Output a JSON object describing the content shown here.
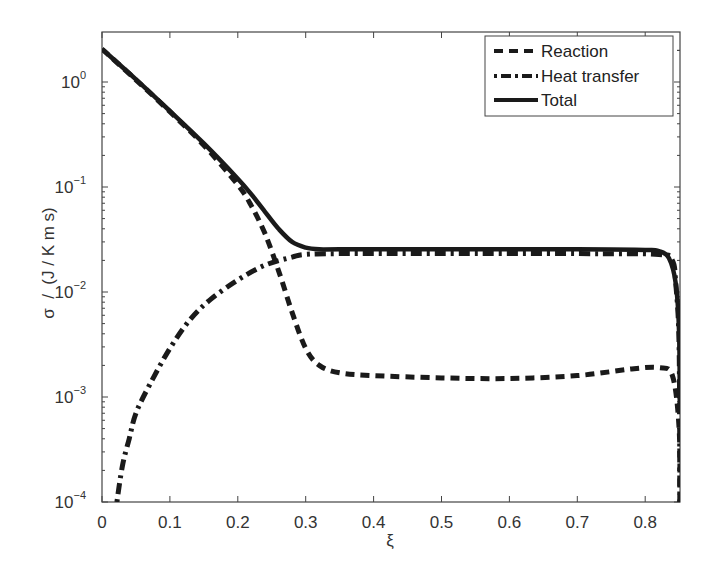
{
  "chart_data": {
    "type": "line",
    "title": "",
    "xlabel": "ξ",
    "ylabel": "σ  /  (J / K m s)",
    "xscale": "linear",
    "yscale": "log",
    "xlim": [
      0,
      0.851
    ],
    "ylim": [
      0.0001,
      3.0
    ],
    "x_ticks": [
      "0",
      "0.1",
      "0.2",
      "0.3",
      "0.4",
      "0.5",
      "0.6",
      "0.7",
      "0.8"
    ],
    "x_tick_values": [
      0,
      0.1,
      0.2,
      0.3,
      0.4,
      0.5,
      0.6,
      0.7,
      0.8
    ],
    "y_ticks": [
      {
        "base": "10",
        "exp": "0",
        "value": 1
      },
      {
        "base": "10",
        "exp": "−1",
        "value": 0.1
      },
      {
        "base": "10",
        "exp": "−2",
        "value": 0.01
      },
      {
        "base": "10",
        "exp": "−3",
        "value": 0.001
      },
      {
        "base": "10",
        "exp": "−4",
        "value": 0.0001
      }
    ],
    "grid": false,
    "legend_position": "upper right",
    "series": [
      {
        "name": "Reaction",
        "style": "dashed",
        "x": [
          0.0,
          0.05,
          0.1,
          0.15,
          0.2,
          0.22,
          0.24,
          0.26,
          0.28,
          0.3,
          0.32,
          0.35,
          0.4,
          0.5,
          0.6,
          0.7,
          0.78,
          0.82,
          0.84,
          0.85,
          0.851
        ],
        "y": [
          2.06,
          1.05,
          0.52,
          0.25,
          0.105,
          0.066,
          0.036,
          0.016,
          0.0064,
          0.0029,
          0.002,
          0.0017,
          0.0016,
          0.00152,
          0.0015,
          0.0016,
          0.00185,
          0.0019,
          0.0016,
          0.0005,
          0.0001
        ]
      },
      {
        "name": "Heat transfer",
        "style": "dashdot",
        "x": [
          0.022,
          0.03,
          0.04,
          0.05,
          0.07,
          0.1,
          0.13,
          0.16,
          0.2,
          0.24,
          0.28,
          0.3,
          0.35,
          0.5,
          0.7,
          0.82,
          0.84,
          0.845,
          0.85,
          0.851
        ],
        "y": [
          0.0001,
          0.00022,
          0.0004,
          0.0007,
          0.0013,
          0.0029,
          0.0055,
          0.0085,
          0.013,
          0.018,
          0.0215,
          0.0228,
          0.0232,
          0.0232,
          0.0232,
          0.0228,
          0.02,
          0.012,
          0.003,
          0.0001
        ]
      },
      {
        "name": "Total",
        "style": "solid",
        "x": [
          0.0,
          0.05,
          0.1,
          0.15,
          0.2,
          0.22,
          0.24,
          0.26,
          0.28,
          0.3,
          0.32,
          0.35,
          0.5,
          0.7,
          0.8,
          0.82,
          0.835,
          0.845,
          0.85,
          0.851
        ],
        "y": [
          2.06,
          1.06,
          0.53,
          0.26,
          0.12,
          0.085,
          0.058,
          0.04,
          0.03,
          0.0265,
          0.0255,
          0.0255,
          0.0255,
          0.0255,
          0.0252,
          0.0245,
          0.021,
          0.012,
          0.004,
          0.0007
        ]
      }
    ]
  },
  "legend": {
    "items": [
      {
        "label": "Reaction",
        "style": "dashed"
      },
      {
        "label": "Heat transfer",
        "style": "dashdot"
      },
      {
        "label": "Total",
        "style": "solid"
      }
    ]
  },
  "colors": {
    "line": "#1a1a1a",
    "axis": "#444444",
    "background": "#ffffff"
  }
}
